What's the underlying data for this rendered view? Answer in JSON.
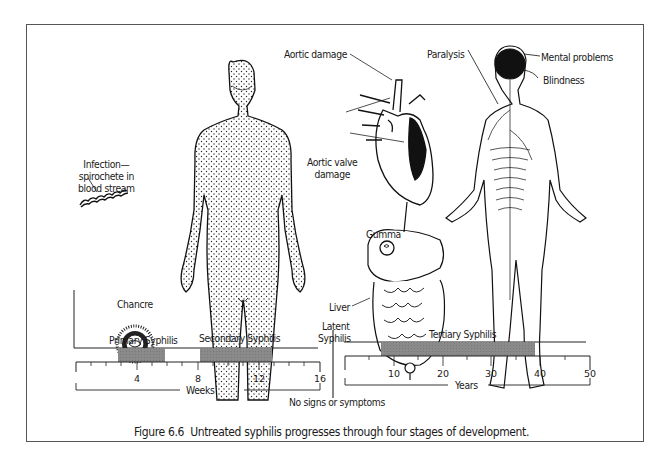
{
  "figure": {
    "caption_number": "Figure 6.6",
    "caption_text": "Untreated syphilis progresses through four stages of development."
  },
  "illustrations": {
    "spirochete": {
      "label": "Infection—\nspirochete in\nblood stream",
      "line1": "Infection—",
      "line2": "spirochete in",
      "line3": "blood stream"
    },
    "chancre": {
      "label": "Chancre"
    },
    "rash_body": {
      "label": ""
    },
    "heart": {
      "labels": [
        "Aortic damage",
        "Aortic valve damage"
      ],
      "aortic_damage": "Aortic damage",
      "aortic_valve_line1": "Aortic valve",
      "aortic_valve_line2": "damage"
    },
    "digestive": {
      "labels": [
        "Gumma",
        "Liver"
      ],
      "gumma": "Gumma",
      "liver": "Liver"
    },
    "nervous_system": {
      "labels": [
        "Paralysis",
        "Mental problems",
        "Blindness"
      ],
      "paralysis": "Paralysis",
      "mental": "Mental problems",
      "blindness": "Blindness"
    }
  },
  "timeline": {
    "stages": [
      {
        "name": "Primary Syphilis",
        "start_weeks": 3,
        "end_weeks": 6
      },
      {
        "name": "Secondary Syphilis",
        "start_weeks": 8.3,
        "end_weeks": 13
      },
      {
        "name": "Latent Syphilis",
        "note": "No signs or symptoms"
      },
      {
        "name": "Tertiary Syphilis",
        "start_years": 8,
        "end_years": 40
      }
    ],
    "latent_line1": "Latent",
    "latent_line2": "Syphilis",
    "latent_note": "No signs or symptoms",
    "weeks_axis": {
      "label": "Weeks",
      "ticks": [
        "4",
        "8",
        "12",
        "16"
      ]
    },
    "years_axis": {
      "label": "Years",
      "ticks": [
        "10",
        "20",
        "30",
        "40",
        "50"
      ]
    },
    "bar_color": "#8a8a8a"
  }
}
